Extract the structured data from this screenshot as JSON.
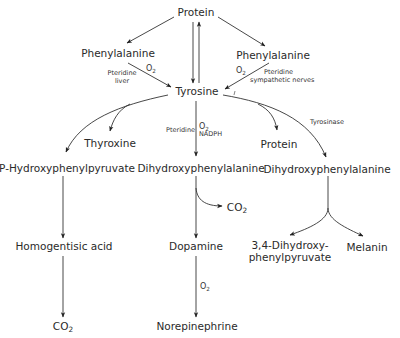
{
  "diagram": {
    "type": "metabolic-pathway",
    "nodes": {
      "protein_top": "Protein",
      "phenylalanine_left": "Phenylalanine",
      "phenylalanine_right": "Phenylalanine",
      "tyrosine": "Tyrosine",
      "thyroxine": "Thyroxine",
      "protein_mid": "Protein",
      "p_hydroxyphenylpyruvate": "P-Hydroxyphenylpyruvate",
      "dihydroxyphenylalanine_center": "Dihydroxyphenylalanine",
      "dihydroxyphenylalanine_right": "Dihydroxyphenylalanine",
      "co2_center": "CO",
      "homogentisic_acid": "Homogentisic acid",
      "dopamine": "Dopamine",
      "dihydroxyphenylpyruvate_line1": "3,4-Dihydroxy-",
      "dihydroxyphenylpyruvate_line2": "phenylpyruvate",
      "melanin": "Melanin",
      "co2_bottom": "CO",
      "norepinephrine": "Norepinephrine"
    },
    "subscripts": {
      "two": "2"
    },
    "annotations": {
      "left_o2": "O",
      "left_cofactor_line1": "Pteridine",
      "left_cofactor_line2": "liver",
      "right_o2": "O",
      "right_cofactor_line1": "Pteridine",
      "right_cofactor_line2": "sympathetic nerves",
      "center_cofactor": "Pteridine",
      "center_o2": "O",
      "center_nadph": "NADPH",
      "tyrosinase": "Tyrosinase",
      "dopamine_o2": "O"
    },
    "edges": [
      {
        "from": "Protein",
        "to": "Phenylalanine (left)"
      },
      {
        "from": "Protein",
        "to": "Phenylalanine (right)"
      },
      {
        "from": "Protein",
        "to": "Tyrosine"
      },
      {
        "from": "Tyrosine",
        "to": "Protein"
      },
      {
        "from": "Phenylalanine (left)",
        "to": "Tyrosine",
        "label": "O2; Pteridine liver"
      },
      {
        "from": "Phenylalanine (right)",
        "to": "Tyrosine",
        "label": "O2; Pteridine sympathetic nerves"
      },
      {
        "from": "Tyrosine",
        "to": "P-Hydroxyphenylpyruvate"
      },
      {
        "from": "Tyrosine",
        "to": "Thyroxine"
      },
      {
        "from": "Tyrosine",
        "to": "Dihydroxyphenylalanine (center)",
        "label": "Pteridine O2 NADPH"
      },
      {
        "from": "Tyrosine",
        "to": "Protein (mid)"
      },
      {
        "from": "Tyrosine",
        "to": "Dihydroxyphenylalanine (right)",
        "label": "Tyrosinase"
      },
      {
        "from": "P-Hydroxyphenylpyruvate",
        "to": "Homogentisic acid"
      },
      {
        "from": "Homogentisic acid",
        "to": "CO2"
      },
      {
        "from": "Dihydroxyphenylalanine (center)",
        "to": "CO2"
      },
      {
        "from": "Dihydroxyphenylalanine (center)",
        "to": "Dopamine"
      },
      {
        "from": "Dopamine",
        "to": "Norepinephrine",
        "label": "O2"
      },
      {
        "from": "Dihydroxyphenylalanine (right)",
        "to": "3,4-Dihydroxyphenylpyruvate"
      },
      {
        "from": "Dihydroxyphenylalanine (right)",
        "to": "Melanin"
      }
    ]
  }
}
